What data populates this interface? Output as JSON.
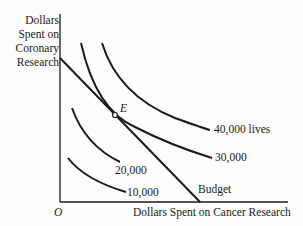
{
  "diagram": {
    "y_axis_label": [
      "Dollars",
      "Spent on",
      "Coronary",
      "Research"
    ],
    "x_axis_label": "Dollars Spent on Cancer Research",
    "origin_label": "O",
    "equilibrium_label": "E",
    "budget_label": "Budget",
    "curves": [
      {
        "label": "10,000"
      },
      {
        "label": "20,000"
      },
      {
        "label": "30,000"
      },
      {
        "label": "40,000 lives"
      }
    ],
    "colors": {
      "ink": "#1a1a1a",
      "background": "#fdfdfb"
    }
  }
}
